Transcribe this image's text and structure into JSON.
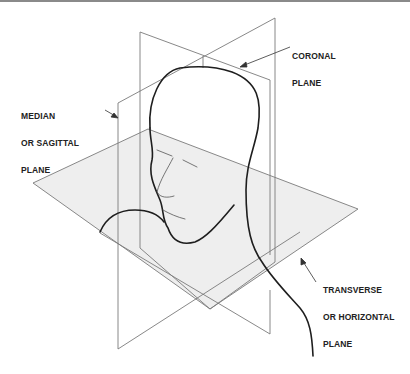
{
  "figure": {
    "labels": {
      "coronal": [
        "CORONAL",
        "PLANE"
      ],
      "median": [
        "MEDIAN",
        "OR SAGITTAL",
        "PLANE"
      ],
      "transverse": [
        "TRANSVERSE",
        "OR HORIZONTAL",
        "PLANE"
      ]
    },
    "colors": {
      "plane_line": "#7a7a7a",
      "plane_fill": "#ececec",
      "head_line": "#1e1e1e",
      "label_text": "#222222",
      "top_border": "#8a8a8a"
    }
  }
}
